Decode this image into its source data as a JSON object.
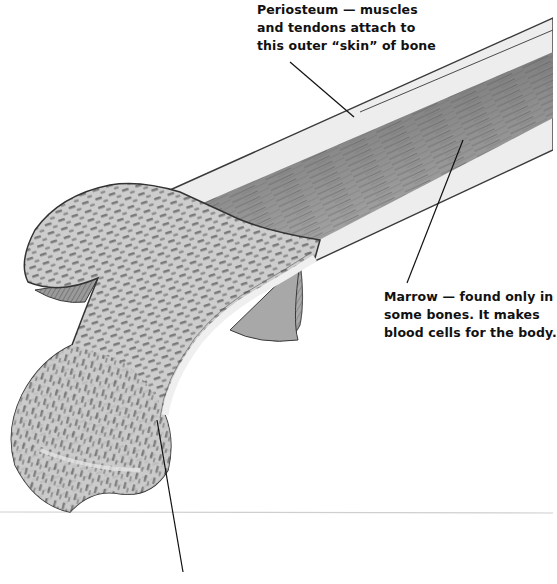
{
  "diagram": {
    "colors": {
      "background": "#ffffff",
      "bone_spongy_fill": "#c8c8c8",
      "bone_spongy_pores": "#6e6e6e",
      "compact_bone": "#ececec",
      "marrow_cavity": "#8a8a8a",
      "outline": "#3a3a3a",
      "leader_line": "#111111",
      "label_text": "#111111",
      "ground_line": "#cfcfcf"
    },
    "labels": [
      {
        "id": "periosteum",
        "lines": [
          "Periosteum — muscles",
          "and tendons attach to",
          "this outer “skin” of bone"
        ],
        "leader": {
          "x1": 290,
          "y1": 62,
          "x2": 354,
          "y2": 117
        }
      },
      {
        "id": "marrow",
        "lines": [
          "Marrow — found only in",
          "some bones. It makes",
          "blood cells for the body."
        ],
        "leader": {
          "x1": 407,
          "y1": 283,
          "x2": 463,
          "y2": 140
        }
      },
      {
        "id": "spongy-bone",
        "lines": [],
        "leader": {
          "x1": 157,
          "y1": 420,
          "x2": 183,
          "y2": 572
        }
      }
    ]
  }
}
